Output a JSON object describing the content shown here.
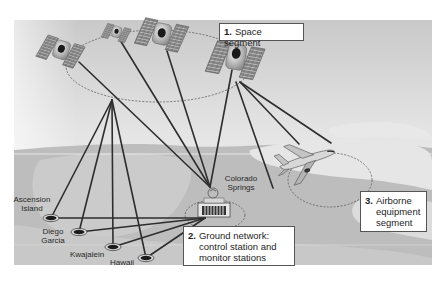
{
  "diagram": {
    "segments": [
      {
        "id": "space",
        "number": "1.",
        "label": "Space segment"
      },
      {
        "id": "ground",
        "number": "2.",
        "label_lines": [
          "Ground network:",
          "control station and",
          "monitor stations"
        ]
      },
      {
        "id": "airborne",
        "number": "3.",
        "label_lines": [
          "Airborne",
          "equipment",
          "segment"
        ]
      }
    ],
    "control_station": {
      "name_lines": [
        "Colorado",
        "Springs"
      ]
    },
    "monitor_stations": [
      {
        "name_lines": [
          "Ascension",
          "Island"
        ]
      },
      {
        "name_lines": [
          "Diego",
          "Garcia"
        ]
      },
      {
        "name_lines": [
          "Kwajalein"
        ]
      },
      {
        "name_lines": [
          "Hawaii"
        ]
      }
    ],
    "satellites_count": 4,
    "colors": {
      "sky_top": "#c8c8c8",
      "sky_bottom": "#f4f4f4",
      "land": "#b4b4b4",
      "cloud": "#e6e6e6",
      "line": "#2e2e2e",
      "dashed": "#5a5a5a",
      "box_border": "#555555"
    }
  }
}
